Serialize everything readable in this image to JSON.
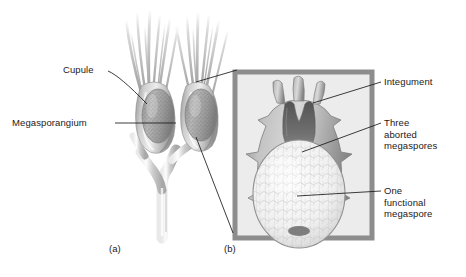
{
  "figure": {
    "background": "#ffffff",
    "ink": "#1a1a1a",
    "panels": [
      {
        "id": "panel-a",
        "label": "(a)",
        "x": 109,
        "y": 243,
        "caption": "Whole cupulate branch system"
      },
      {
        "id": "panel-b",
        "label": "(b)",
        "x": 224,
        "y": 243,
        "caption": "Longitudinal section of ovule"
      }
    ],
    "inset": {
      "x": 235,
      "y": 72,
      "width": 137,
      "height": 166,
      "border_color": "#8d8d8d",
      "fill_color": "#ececec",
      "border_width": 5
    }
  },
  "labels": [
    {
      "name": "label-cupule",
      "text": "Cupule",
      "side": "left",
      "x": 63,
      "y": 64,
      "leader": {
        "from": [
          108,
          71
        ],
        "to": [
          147,
          104
        ]
      }
    },
    {
      "name": "label-megasporangium",
      "text": "Megasporangium",
      "side": "left",
      "x": 12,
      "y": 117,
      "leader": {
        "from": [
          115,
          123
        ],
        "to": [
          176,
          123
        ]
      }
    },
    {
      "name": "label-integument",
      "text": "Integument",
      "side": "right",
      "x": 384,
      "y": 76,
      "lines": [
        "Integument"
      ],
      "leader": {
        "from": [
          381,
          82
        ],
        "to": [
          313,
          103
        ]
      }
    },
    {
      "name": "label-three-aborted-megaspores",
      "text": "Three aborted megaspores",
      "side": "right",
      "x": 384,
      "y": 117,
      "lines": [
        "Three",
        "aborted",
        "megaspores"
      ],
      "leader": {
        "from": [
          381,
          123
        ],
        "to": [
          302,
          152
        ]
      }
    },
    {
      "name": "label-one-functional-megaspore",
      "text": "One functional megaspore",
      "side": "right",
      "x": 384,
      "y": 185,
      "lines": [
        "One",
        "functional",
        "megaspore"
      ],
      "leader": {
        "from": [
          381,
          191
        ],
        "to": [
          297,
          196
        ]
      }
    },
    {
      "name": "label-panel-b-leader",
      "text": "",
      "side": "none",
      "leader": {
        "from": [
          196,
          137
        ],
        "to": [
          233,
          233
        ]
      }
    },
    {
      "name": "label-right-cupule-leader",
      "text": "",
      "side": "none",
      "leader": {
        "from": [
          237,
          70
        ],
        "to": [
          196,
          82
        ]
      }
    }
  ],
  "structures": {
    "plant": {
      "name": "cupulate-branch-system",
      "stem_color": "#c9c9c9",
      "cupule_color": "#b8b8b8",
      "megasporangium_color": "#a5a5a5",
      "clusters": 2,
      "description": "Forking axis bearing two cupules, each enclosing a stippled megasporangium, with slender tendril-like cupule lobes above"
    },
    "ovule": {
      "name": "ovule-section",
      "integument_color": "#b0b0b0",
      "integument_cavity_color": "#6f6f6f",
      "aborted_megaspores_color": "#3a3a3a",
      "functional_megaspore_color": "#f2f2f2",
      "lobes": 3,
      "description": "Sectioned ovule showing three integument lobes, three dark aborted megaspores at the neck, and one large pale functional megaspore"
    }
  }
}
